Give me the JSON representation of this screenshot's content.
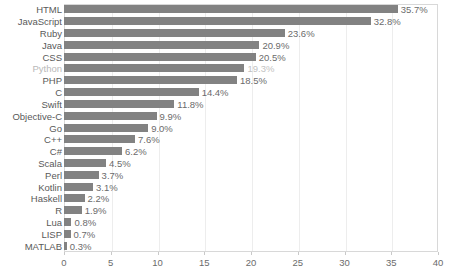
{
  "chart_data": {
    "type": "bar",
    "orientation": "horizontal",
    "title": "",
    "subtitle": "",
    "xlabel": "",
    "ylabel": "",
    "xlim": [
      0,
      40
    ],
    "xticks": [
      "0",
      "5",
      "10",
      "15",
      "20",
      "25",
      "30",
      "35",
      "40"
    ],
    "xtick_values": [
      0,
      5,
      10,
      15,
      20,
      25,
      30,
      35,
      40
    ],
    "grid": true,
    "grid_axis": "x",
    "legend": false,
    "legend_position": "none",
    "bar_color": "#828282",
    "label_color": "#595959",
    "value_label_color": "#6b6b6b",
    "value_suffix": "%",
    "categories": [
      "HTML",
      "JavaScript",
      "Ruby",
      "Java",
      "CSS",
      "Python",
      "PHP",
      "C",
      "Swift",
      "Objective-C",
      "Go",
      "C++",
      "C#",
      "Scala",
      "Perl",
      "Kotlin",
      "Haskell",
      "R",
      "Lua",
      "LISP",
      "MATLAB"
    ],
    "values": [
      35.7,
      32.8,
      23.6,
      20.9,
      20.5,
      19.3,
      18.5,
      14.4,
      11.8,
      9.9,
      9.0,
      7.6,
      6.2,
      4.5,
      3.7,
      3.1,
      2.2,
      1.9,
      0.8,
      0.7,
      0.3
    ],
    "value_labels": [
      "35.7%",
      "32.8%",
      "23.6%",
      "20.9%",
      "20.5%",
      "19.3%",
      "18.5%",
      "14.4%",
      "11.8%",
      "9.9%",
      "9.0%",
      "7.6%",
      "6.2%",
      "4.5%",
      "3.7%",
      "3.1%",
      "2.2%",
      "1.9%",
      "0.8%",
      "0.7%",
      "0.3%"
    ]
  }
}
